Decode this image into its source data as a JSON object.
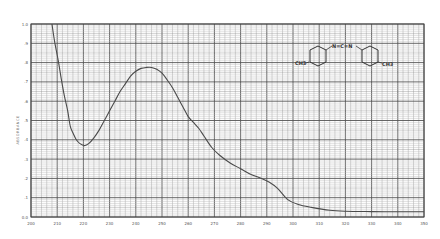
{
  "chart_data": {
    "type": "line",
    "title": "",
    "xlabel": "",
    "ylabel": "ABSORBANCE",
    "xlim": [
      200,
      350
    ],
    "ylim": [
      0.0,
      1.0
    ],
    "grid": true,
    "x_ticks": [
      200,
      210,
      220,
      230,
      240,
      250,
      260,
      270,
      280,
      290,
      300,
      310,
      320,
      330,
      340,
      350
    ],
    "x_tick_labels": [
      "200",
      "210",
      "220",
      "230",
      "240",
      "250",
      "260",
      "270",
      "280",
      "290",
      "300",
      "310",
      "320",
      "330",
      "340",
      "350"
    ],
    "y_ticks": [
      0.0,
      0.1,
      0.2,
      0.3,
      0.4,
      0.5,
      0.6,
      0.7,
      0.8,
      0.9,
      1.0
    ],
    "y_tick_labels": [
      "0.0",
      ".1",
      ".2",
      ".3",
      ".4",
      ".5",
      ".6",
      ".7",
      ".8",
      ".9",
      "1.0"
    ],
    "series": [
      {
        "name": "spectrum",
        "color": "#4a4a4a",
        "x": [
          208,
          209,
          210.4,
          211.5,
          212.7,
          214,
          215,
          216.2,
          217.3,
          218.7,
          220.4,
          222,
          224,
          226,
          228,
          230,
          232,
          234,
          236,
          238,
          240,
          242,
          244,
          246,
          248,
          250,
          252,
          254,
          256,
          258,
          260,
          262,
          264,
          266,
          269,
          272,
          276,
          280,
          284,
          288,
          291,
          294,
          298,
          302,
          307,
          314,
          320,
          330,
          340,
          350
        ],
        "y": [
          1.0,
          0.91,
          0.81,
          0.72,
          0.63,
          0.55,
          0.47,
          0.43,
          0.4,
          0.38,
          0.37,
          0.38,
          0.41,
          0.45,
          0.5,
          0.55,
          0.6,
          0.65,
          0.69,
          0.73,
          0.755,
          0.77,
          0.775,
          0.775,
          0.765,
          0.745,
          0.71,
          0.67,
          0.62,
          0.57,
          0.52,
          0.49,
          0.46,
          0.42,
          0.36,
          0.32,
          0.28,
          0.25,
          0.22,
          0.2,
          0.18,
          0.15,
          0.09,
          0.065,
          0.05,
          0.035,
          0.03,
          0.028,
          0.027,
          0.027
        ]
      }
    ],
    "annotations": [
      {
        "type": "chemical-structure",
        "name": "di-p-tolylcarbodiimide",
        "left_group": "CH3",
        "linker": "N=C=N",
        "right_group": "CH3",
        "position": "top-right"
      }
    ]
  }
}
